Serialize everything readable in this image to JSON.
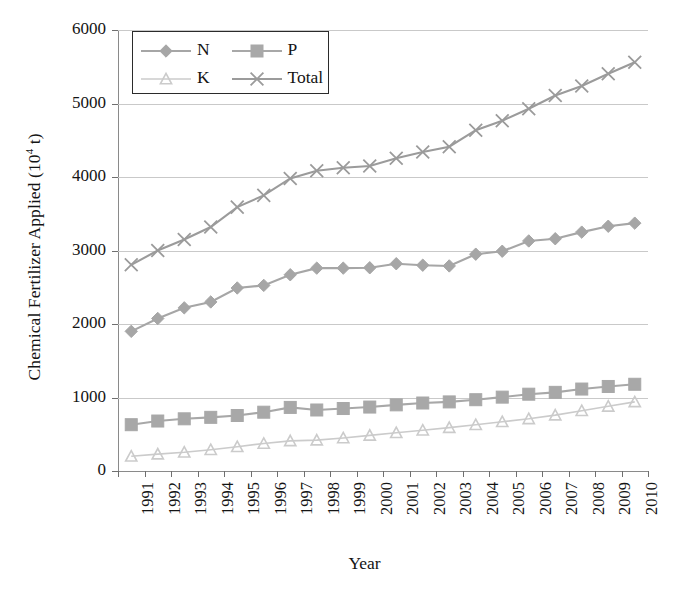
{
  "chart_data": {
    "type": "line",
    "title": "",
    "xlabel": "Year",
    "ylabel": "Chemical Fertilizer Applied (10⁴ t)",
    "ylabel_text": "Chemical Fertilizer Applied (10",
    "ylabel_sup": "4",
    "ylabel_tail": " t)",
    "categories": [
      "1991",
      "1992",
      "1993",
      "1994",
      "1995",
      "1996",
      "1997",
      "1998",
      "1999",
      "2000",
      "2001",
      "2002",
      "2003",
      "2004",
      "2005",
      "2006",
      "2007",
      "2008",
      "2009",
      "2010"
    ],
    "x": [
      1991,
      1992,
      1993,
      1994,
      1995,
      1996,
      1997,
      1998,
      1999,
      2000,
      2001,
      2002,
      2003,
      2004,
      2005,
      2006,
      2007,
      2008,
      2009,
      2010
    ],
    "ylim": [
      0,
      6000
    ],
    "yticks": [
      0,
      1000,
      2000,
      3000,
      4000,
      5000,
      6000
    ],
    "ytick_labels": [
      "0",
      "1000",
      "2000",
      "3000",
      "4000",
      "5000",
      "6000"
    ],
    "grid": true,
    "legend_position": "top-left",
    "series": [
      {
        "name": "N",
        "marker": "diamond",
        "color": "#a6a6a6",
        "values": [
          1900,
          2075,
          2220,
          2300,
          2490,
          2525,
          2670,
          2760,
          2760,
          2765,
          2820,
          2800,
          2790,
          2950,
          2990,
          3130,
          3160,
          3250,
          3330,
          3372
        ]
      },
      {
        "name": "P",
        "marker": "square",
        "color": "#a8a8a8",
        "values": [
          630,
          680,
          710,
          730,
          755,
          800,
          865,
          830,
          850,
          870,
          900,
          925,
          940,
          970,
          1005,
          1045,
          1070,
          1115,
          1150,
          1180
        ]
      },
      {
        "name": "K",
        "marker": "triangle",
        "color": "#cbcbcb",
        "values": [
          200,
          230,
          255,
          290,
          330,
          375,
          410,
          420,
          450,
          485,
          520,
          555,
          590,
          630,
          670,
          710,
          760,
          820,
          880,
          940
        ]
      },
      {
        "name": "Total",
        "marker": "cross",
        "color": "#9b9b9b",
        "values": [
          2805,
          3000,
          3150,
          3320,
          3590,
          3750,
          3980,
          4085,
          4125,
          4150,
          4254,
          4339,
          4412,
          4637,
          4766,
          4928,
          5108,
          5239,
          5404,
          5562
        ]
      }
    ]
  },
  "legend": {
    "entries": [
      {
        "label": "N",
        "marker": "diamond"
      },
      {
        "label": "P",
        "marker": "square"
      },
      {
        "label": "K",
        "marker": "triangle"
      },
      {
        "label": "Total",
        "marker": "cross"
      }
    ]
  },
  "colors": {
    "axis": "#8a8a8a",
    "grid": "#c9c9c9",
    "text": "#141414",
    "legend_border": "#2b2b2b",
    "background": "#ffffff"
  }
}
